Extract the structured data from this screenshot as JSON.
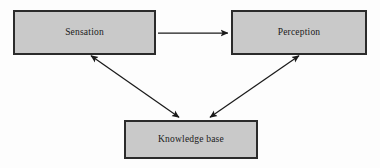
{
  "diagram": {
    "canvas": {
      "width": 380,
      "height": 168,
      "background": "#fdfdfd"
    },
    "style": {
      "node_fill": "#c9c9c9",
      "node_border": "#2b2b2b",
      "edge_color": "#1a1a1a",
      "label_color": "#1a1a1a"
    },
    "nodes": [
      {
        "id": "sensation",
        "label": "Sensation",
        "x": 13,
        "y": 10,
        "width": 143,
        "height": 45
      },
      {
        "id": "perception",
        "label": "Perception",
        "x": 231,
        "y": 10,
        "width": 136,
        "height": 45
      },
      {
        "id": "knowledge_base",
        "label": "Knowledge base",
        "x": 124,
        "y": 120,
        "width": 134,
        "height": 39
      }
    ],
    "edges": [
      {
        "id": "sensation-to-perception",
        "from": "sensation",
        "to": "perception",
        "direction": "forward",
        "x1": 158,
        "y1": 33,
        "x2": 229,
        "y2": 33
      },
      {
        "id": "sensation-knowledge-base",
        "from": "sensation",
        "to": "knowledge_base",
        "direction": "both",
        "x1": 90,
        "y1": 55,
        "x2": 180,
        "y2": 118
      },
      {
        "id": "perception-knowledge-base",
        "from": "perception",
        "to": "knowledge_base",
        "direction": "both",
        "x1": 300,
        "y1": 55,
        "x2": 209,
        "y2": 118
      }
    ]
  }
}
